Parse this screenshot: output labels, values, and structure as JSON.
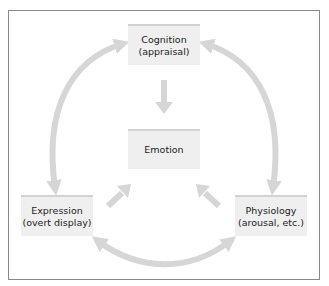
{
  "diagram": {
    "nodes": {
      "cognition": {
        "line1": "Cognition",
        "line2": "(appraisal)"
      },
      "emotion": {
        "line1": "Emotion"
      },
      "expression": {
        "line1": "Expression",
        "line2": "(overt display)"
      },
      "physiology": {
        "line1": "Physiology",
        "line2": "(arousal, etc.)"
      }
    },
    "edges": [
      {
        "from": "cognition",
        "to": "emotion",
        "style": "straight",
        "direction": "one-way"
      },
      {
        "from": "expression",
        "to": "emotion",
        "style": "straight",
        "direction": "one-way"
      },
      {
        "from": "physiology",
        "to": "emotion",
        "style": "straight",
        "direction": "one-way"
      },
      {
        "from": "cognition",
        "to": "expression",
        "style": "curved",
        "direction": "two-way"
      },
      {
        "from": "cognition",
        "to": "physiology",
        "style": "curved",
        "direction": "two-way"
      },
      {
        "from": "expression",
        "to": "physiology",
        "style": "curved",
        "direction": "two-way"
      }
    ],
    "colors": {
      "box_fill": "#efefef",
      "box_top_border": "#d2d2d2",
      "arrow": "#d6d6d6",
      "frame": "#8a8a8a",
      "text": "#1c1c1c"
    }
  }
}
